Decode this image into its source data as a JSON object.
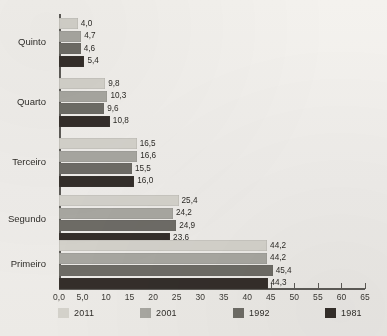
{
  "chart_data": {
    "type": "bar",
    "orientation": "horizontal",
    "title": "",
    "subtitle": "",
    "xlabel": "",
    "ylabel": "",
    "categories": [
      "Quinto",
      "Quarto",
      "Terceiro",
      "Segundo",
      "Primeiro"
    ],
    "series": [
      {
        "name": "2011",
        "color": "#d4d2cb",
        "values": [
          4.0,
          9.8,
          16.5,
          25.4,
          44.2
        ]
      },
      {
        "name": "2001",
        "color": "#a8a7a1",
        "values": [
          4.7,
          10.3,
          16.6,
          24.2,
          44.2
        ]
      },
      {
        "name": "1992",
        "color": "#6e6c66",
        "values": [
          4.6,
          9.6,
          15.5,
          24.9,
          45.4
        ]
      },
      {
        "name": "1981",
        "color": "#342e2a",
        "values": [
          5.4,
          10.8,
          16.0,
          23.6,
          44.3
        ]
      }
    ],
    "value_labels": {
      "Quinto": [
        "4,0",
        "4,7",
        "4,6",
        "5,4"
      ],
      "Quarto": [
        "9,8",
        "10,3",
        "9,6",
        "10,8"
      ],
      "Terceiro": [
        "16,5",
        "16,6",
        "15,5",
        "16,0"
      ],
      "Segundo": [
        "25,4",
        "24,2",
        "24,9",
        "23,6"
      ],
      "Primeiro": [
        "44,2",
        "44,2",
        "45,4",
        "44,3"
      ]
    },
    "xlim": [
      0,
      65
    ],
    "xticks": [
      0,
      5,
      10,
      15,
      20,
      25,
      30,
      35,
      40,
      45,
      50,
      55,
      60,
      65
    ],
    "xtick_labels": [
      "0,0",
      "5,0",
      "10",
      "15",
      "20",
      "25",
      "30",
      "35",
      "40",
      "45",
      "50",
      "55",
      "60",
      "65"
    ],
    "grid": false,
    "legend_position": "bottom",
    "legend_entries": [
      "2011",
      "2001",
      "1992",
      "1981"
    ]
  }
}
